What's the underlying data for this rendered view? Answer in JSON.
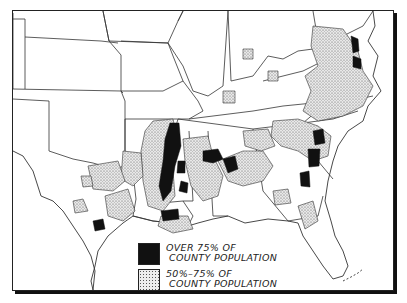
{
  "map": {
    "title": "",
    "region": "Southern United States",
    "style": "black-and-white county choropleth",
    "colors": {
      "over_75": "#111111",
      "between_50_75": "stippled gray",
      "background": "#ffffff",
      "outline": "#333333"
    }
  },
  "legend": {
    "items": [
      {
        "swatch": "solid-black",
        "line1": "OVER 75% OF",
        "line2": "COUNTY POPULATION"
      },
      {
        "swatch": "stippled",
        "line1": "50%–75% OF",
        "line2": "COUNTY POPULATION"
      }
    ]
  }
}
